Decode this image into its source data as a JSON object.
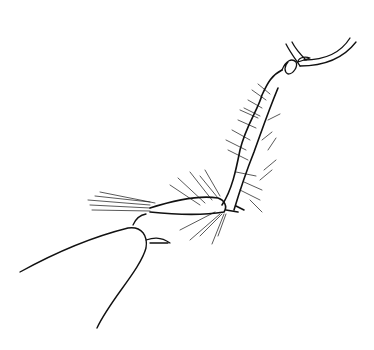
{
  "figure": {
    "style": "black ink line drawing on white",
    "colors": {
      "ink": "#111111",
      "background": "#ffffff"
    },
    "caption": ""
  }
}
